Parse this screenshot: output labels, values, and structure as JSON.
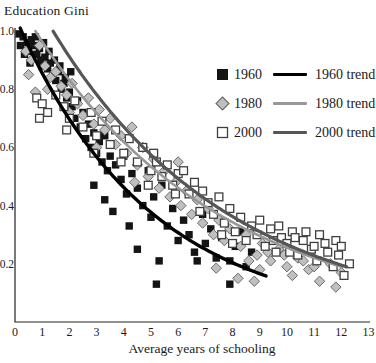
{
  "title": "Education Gini",
  "x_axis_label": "Average years of schooling",
  "legend": {
    "rows": [
      {
        "series_label": "1960",
        "trend_label": "1960 trend"
      },
      {
        "series_label": "1980",
        "trend_label": "1980 trend"
      },
      {
        "series_label": "2000",
        "trend_label": "2000 trend"
      }
    ]
  },
  "chart_data": {
    "type": "scatter",
    "title": "Education Gini",
    "xlabel": "Average years of schooling",
    "ylabel": "Education Gini",
    "xlim": [
      0,
      13
    ],
    "ylim": [
      0,
      1.0
    ],
    "x_ticks": [
      "0",
      "1",
      "2",
      "3",
      "4",
      "5",
      "6",
      "7",
      "8",
      "9",
      "10",
      "11",
      "12",
      "13"
    ],
    "y_ticks": [
      {
        "label": "1.0",
        "value": 1.0
      },
      {
        "label": "0.8",
        "value": 0.8
      },
      {
        "label": "0.6",
        "value": 0.6
      },
      {
        "label": "0.4",
        "value": 0.4
      },
      {
        "label": "0.2",
        "value": 0.2
      }
    ],
    "grid": false,
    "legend_position": "upper right",
    "axis_color": "#222222",
    "series": [
      {
        "name": "1960",
        "marker": "filled-square",
        "color": "#141414",
        "stroke": "#141414",
        "fill": "#141414",
        "points": [
          [
            0.15,
            0.99
          ],
          [
            0.3,
            0.98
          ],
          [
            0.45,
            0.96
          ],
          [
            0.2,
            0.95
          ],
          [
            0.35,
            0.92
          ],
          [
            0.5,
            0.93
          ],
          [
            0.55,
            0.89
          ],
          [
            0.6,
            0.97
          ],
          [
            0.7,
            0.95
          ],
          [
            0.75,
            0.98
          ],
          [
            0.8,
            0.92
          ],
          [
            0.9,
            0.94
          ],
          [
            0.95,
            0.9
          ],
          [
            1.0,
            0.88
          ],
          [
            1.05,
            0.96
          ],
          [
            1.1,
            0.91
          ],
          [
            1.2,
            0.87
          ],
          [
            1.25,
            0.93
          ],
          [
            1.3,
            0.89
          ],
          [
            1.4,
            0.85
          ],
          [
            1.45,
            0.9
          ],
          [
            1.5,
            0.83
          ],
          [
            1.6,
            0.86
          ],
          [
            1.65,
            0.88
          ],
          [
            1.7,
            0.8
          ],
          [
            1.8,
            0.82
          ],
          [
            1.85,
            0.84
          ],
          [
            1.9,
            0.77
          ],
          [
            2.0,
            0.79
          ],
          [
            2.05,
            0.86
          ],
          [
            2.1,
            0.74
          ],
          [
            2.2,
            0.7
          ],
          [
            2.3,
            0.76
          ],
          [
            2.4,
            0.67
          ],
          [
            2.5,
            0.72
          ],
          [
            2.6,
            0.63
          ],
          [
            2.7,
            0.68
          ],
          [
            2.8,
            0.6
          ],
          [
            2.9,
            0.65
          ],
          [
            2.9,
            0.47
          ],
          [
            3.0,
            0.58
          ],
          [
            3.1,
            0.62
          ],
          [
            3.2,
            0.55
          ],
          [
            3.3,
            0.64
          ],
          [
            3.3,
            0.42
          ],
          [
            3.4,
            0.52
          ],
          [
            3.5,
            0.57
          ],
          [
            3.6,
            0.38
          ],
          [
            3.7,
            0.54
          ],
          [
            3.9,
            0.49
          ],
          [
            4.0,
            0.57
          ],
          [
            4.1,
            0.44
          ],
          [
            4.2,
            0.33
          ],
          [
            4.3,
            0.51
          ],
          [
            4.5,
            0.46
          ],
          [
            4.5,
            0.25
          ],
          [
            4.7,
            0.4
          ],
          [
            4.9,
            0.52
          ],
          [
            5.0,
            0.36
          ],
          [
            5.1,
            0.43
          ],
          [
            5.2,
            0.13
          ],
          [
            5.3,
            0.21
          ],
          [
            5.4,
            0.47
          ],
          [
            5.6,
            0.33
          ],
          [
            5.8,
            0.39
          ],
          [
            6.0,
            0.28
          ],
          [
            6.2,
            0.35
          ],
          [
            6.4,
            0.3
          ],
          [
            6.6,
            0.24
          ],
          [
            6.7,
            0.21
          ],
          [
            6.9,
            0.37
          ],
          [
            7.0,
            0.27
          ],
          [
            7.2,
            0.32
          ],
          [
            7.4,
            0.22
          ],
          [
            7.6,
            0.29
          ],
          [
            7.9,
            0.21
          ],
          [
            7.9,
            0.13
          ],
          [
            8.1,
            0.26
          ],
          [
            8.3,
            0.31
          ],
          [
            8.5,
            0.19
          ],
          [
            8.7,
            0.24
          ]
        ]
      },
      {
        "name": "1980",
        "marker": "diamond",
        "color": "#bfbfbf",
        "fill": "#bfbfbf",
        "stroke": "#6a6a6a",
        "points": [
          [
            0.4,
            0.93
          ],
          [
            0.5,
            0.85
          ],
          [
            0.6,
            0.9
          ],
          [
            0.75,
            0.79
          ],
          [
            0.9,
            0.95
          ],
          [
            1.1,
            0.88
          ],
          [
            1.2,
            0.8
          ],
          [
            1.3,
            0.84
          ],
          [
            1.5,
            0.86
          ],
          [
            1.7,
            0.81
          ],
          [
            1.9,
            0.78
          ],
          [
            2.0,
            0.72
          ],
          [
            2.1,
            0.82
          ],
          [
            2.3,
            0.75
          ],
          [
            2.5,
            0.71
          ],
          [
            2.7,
            0.77
          ],
          [
            2.9,
            0.68
          ],
          [
            3.0,
            0.6
          ],
          [
            3.1,
            0.73
          ],
          [
            3.3,
            0.66
          ],
          [
            3.5,
            0.7
          ],
          [
            3.7,
            0.61
          ],
          [
            3.9,
            0.64
          ],
          [
            4.1,
            0.58
          ],
          [
            4.3,
            0.67
          ],
          [
            4.4,
            0.48
          ],
          [
            4.5,
            0.54
          ],
          [
            4.7,
            0.6
          ],
          [
            4.9,
            0.5
          ],
          [
            5.1,
            0.56
          ],
          [
            5.3,
            0.46
          ],
          [
            5.5,
            0.52
          ],
          [
            5.7,
            0.43
          ],
          [
            5.9,
            0.48
          ],
          [
            6.0,
            0.55
          ],
          [
            6.1,
            0.4
          ],
          [
            6.3,
            0.45
          ],
          [
            6.5,
            0.37
          ],
          [
            6.7,
            0.42
          ],
          [
            6.9,
            0.34
          ],
          [
            7.1,
            0.39
          ],
          [
            7.3,
            0.3
          ],
          [
            7.4,
            0.185
          ],
          [
            7.5,
            0.35
          ],
          [
            7.7,
            0.28
          ],
          [
            7.9,
            0.32
          ],
          [
            8.2,
            0.15
          ],
          [
            8.3,
            0.26
          ],
          [
            8.5,
            0.3
          ],
          [
            8.6,
            0.21
          ],
          [
            8.8,
            0.14
          ],
          [
            8.9,
            0.23
          ],
          [
            9.0,
            0.18
          ],
          [
            9.1,
            0.27
          ],
          [
            9.3,
            0.24
          ],
          [
            9.4,
            0.21
          ],
          [
            9.7,
            0.25
          ],
          [
            9.9,
            0.23
          ],
          [
            10.0,
            0.19
          ],
          [
            10.2,
            0.16
          ],
          [
            10.4,
            0.22
          ],
          [
            10.6,
            0.21
          ],
          [
            10.8,
            0.18
          ],
          [
            11.0,
            0.19
          ],
          [
            11.2,
            0.14
          ],
          [
            11.6,
            0.2
          ],
          [
            11.8,
            0.12
          ],
          [
            12.0,
            0.17
          ]
        ]
      },
      {
        "name": "2000",
        "marker": "open-square",
        "color": "#ffffff",
        "fill": "#ffffff",
        "stroke": "#3f3f3f",
        "points": [
          [
            0.8,
            0.77
          ],
          [
            0.9,
            0.7
          ],
          [
            1.0,
            0.75
          ],
          [
            1.2,
            0.72
          ],
          [
            1.5,
            0.78
          ],
          [
            1.8,
            0.74
          ],
          [
            1.9,
            0.66
          ],
          [
            2.0,
            0.7
          ],
          [
            2.2,
            0.76
          ],
          [
            2.5,
            0.67
          ],
          [
            2.8,
            0.72
          ],
          [
            2.9,
            0.58
          ],
          [
            3.0,
            0.64
          ],
          [
            3.2,
            0.69
          ],
          [
            3.5,
            0.61
          ],
          [
            3.7,
            0.66
          ],
          [
            3.9,
            0.55
          ],
          [
            4.0,
            0.58
          ],
          [
            4.2,
            0.63
          ],
          [
            4.5,
            0.55
          ],
          [
            4.7,
            0.6
          ],
          [
            4.9,
            0.47
          ],
          [
            5.0,
            0.52
          ],
          [
            5.1,
            0.58
          ],
          [
            5.2,
            0.55
          ],
          [
            5.4,
            0.5
          ],
          [
            5.6,
            0.54
          ],
          [
            5.8,
            0.47
          ],
          [
            5.9,
            0.44
          ],
          [
            6.0,
            0.51
          ],
          [
            6.2,
            0.52
          ],
          [
            6.4,
            0.44
          ],
          [
            6.6,
            0.48
          ],
          [
            6.8,
            0.38
          ],
          [
            6.9,
            0.45
          ],
          [
            7.1,
            0.41
          ],
          [
            7.3,
            0.37
          ],
          [
            7.5,
            0.43
          ],
          [
            7.6,
            0.3
          ],
          [
            7.7,
            0.34
          ],
          [
            7.9,
            0.39
          ],
          [
            8.0,
            0.27
          ],
          [
            8.1,
            0.31
          ],
          [
            8.3,
            0.36
          ],
          [
            8.5,
            0.28
          ],
          [
            8.7,
            0.33
          ],
          [
            8.9,
            0.3
          ],
          [
            9.0,
            0.35
          ],
          [
            9.2,
            0.26
          ],
          [
            9.4,
            0.32
          ],
          [
            9.5,
            0.28
          ],
          [
            9.6,
            0.24
          ],
          [
            9.7,
            0.33
          ],
          [
            9.8,
            0.29
          ],
          [
            10.0,
            0.27
          ],
          [
            10.1,
            0.24
          ],
          [
            10.2,
            0.31
          ],
          [
            10.3,
            0.29
          ],
          [
            10.4,
            0.23
          ],
          [
            10.6,
            0.28
          ],
          [
            10.7,
            0.31
          ],
          [
            10.9,
            0.25
          ],
          [
            11.0,
            0.26
          ],
          [
            11.1,
            0.21
          ],
          [
            11.2,
            0.3
          ],
          [
            11.4,
            0.27
          ],
          [
            11.5,
            0.24
          ],
          [
            11.7,
            0.19
          ],
          [
            11.8,
            0.28
          ],
          [
            11.9,
            0.23
          ],
          [
            12.0,
            0.26
          ],
          [
            12.1,
            0.16
          ],
          [
            12.3,
            0.2
          ]
        ]
      }
    ],
    "trends": [
      {
        "name": "1960 trend",
        "color": "#000000",
        "width": 3.4,
        "model": "gini = a*exp(-k*x)",
        "a": 1.05,
        "k": 0.205,
        "x_start": 0.19,
        "x_end": 9.3
      },
      {
        "name": "1980 trend",
        "color": "#989898",
        "width": 2.6,
        "model": "gini = a*exp(-k*x)",
        "a": 1.117,
        "k": 0.1476,
        "x_start": 0.75,
        "x_end": 12.05
      },
      {
        "name": "2000 trend",
        "color": "#565656",
        "width": 3.2,
        "model": "gini = a*exp(-k*x)",
        "a": 1.24,
        "k": 0.1538,
        "x_start": 1.4,
        "x_end": 12.2
      }
    ]
  }
}
